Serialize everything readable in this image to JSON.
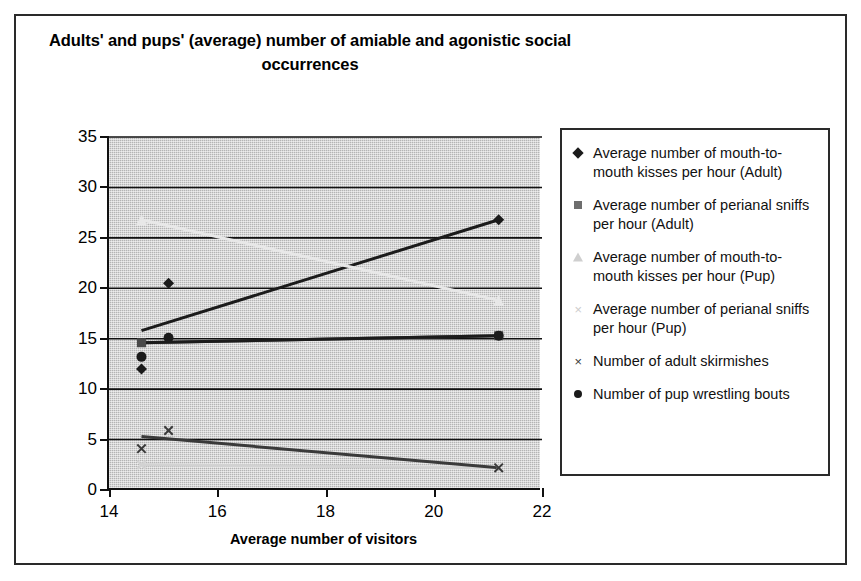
{
  "chart_data": {
    "type": "line",
    "title": "Adults' and pups' (average) number of amiable and agonistic social occurrences",
    "xlabel": "Average number of visitors",
    "ylabel": "Number of occurren",
    "xlim": [
      14,
      22
    ],
    "ylim": [
      0,
      35
    ],
    "xticks": [
      14,
      16,
      18,
      20,
      22
    ],
    "yticks": [
      0,
      5,
      10,
      15,
      20,
      25,
      30,
      35
    ],
    "grid": "horizontal",
    "legend_position": "right",
    "plot_background": "#b4b4b4",
    "series": [
      {
        "name": "Average number of mouth-to-mouth kisses per hour (Adult)",
        "marker": "diamond",
        "color": "#1b1b1b",
        "x": [
          14.6,
          15.1,
          21.2
        ],
        "y": [
          12.0,
          20.5,
          26.8
        ],
        "trend_x": [
          14.6,
          21.2
        ],
        "trend_y": [
          15.8,
          26.8
        ]
      },
      {
        "name": "Average number of perianal sniffs per hour (Adult)",
        "marker": "square",
        "color": "#4a4a4a",
        "x": [
          14.6,
          21.2
        ],
        "y": [
          14.6,
          15.3
        ],
        "trend_x": [
          14.6,
          21.2
        ],
        "trend_y": [
          14.6,
          15.3
        ]
      },
      {
        "name": "Average number of mouth-to-mouth kisses per hour (Pup)",
        "marker": "triangle",
        "color": "#e8e8e8",
        "x": [
          14.6,
          21.2
        ],
        "y": [
          26.8,
          18.8
        ],
        "trend_x": [
          14.6,
          21.2
        ],
        "trend_y": [
          26.8,
          18.8
        ]
      },
      {
        "name": "Average number of perianal sniffs per hour (Pup)",
        "marker": "x",
        "color": "#d2d2d2",
        "x": [
          14.6,
          21.2
        ],
        "y": [
          2.5,
          2.2
        ],
        "trend_x": [
          14.6,
          21.2
        ],
        "trend_y": [
          2.5,
          2.2
        ]
      },
      {
        "name": "Number of adult skirmishes",
        "marker": "x",
        "color": "#3a3a3a",
        "x": [
          14.6,
          15.1,
          21.2
        ],
        "y": [
          4.1,
          5.9,
          2.2
        ],
        "trend_x": [
          14.6,
          21.2
        ],
        "trend_y": [
          5.3,
          2.2
        ]
      },
      {
        "name": "Number of pup wrestling bouts",
        "marker": "circle",
        "color": "#1b1b1b",
        "x": [
          14.6,
          15.1,
          21.2
        ],
        "y": [
          13.2,
          15.1,
          15.3
        ],
        "trend_x": [
          14.6,
          21.2
        ],
        "trend_y": [
          14.6,
          15.3
        ]
      }
    ]
  },
  "legend": {
    "items": [
      {
        "marker": "diamond-marker",
        "label": "Average number of mouth-to-\nmouth kisses per hour (Adult)"
      },
      {
        "marker": "square-marker",
        "label": "Average number of perianal sniffs\nper hour (Adult)"
      },
      {
        "marker": "triangle-marker",
        "label": "Average number of mouth-to-\nmouth kisses per hour (Pup)"
      },
      {
        "marker": "x-marker-light",
        "label": "Average number of perianal sniffs\nper hour (Pup)"
      },
      {
        "marker": "x-marker",
        "label": "Number of adult skirmishes"
      },
      {
        "marker": "circle-marker",
        "label": "Number of pup wrestling bouts"
      }
    ],
    "x_glyph": "×"
  },
  "axes": {
    "y_title": "Number of occurren",
    "x_title": "Average number of visitors",
    "y_tick_labels": [
      "0",
      "5",
      "10",
      "15",
      "20",
      "25",
      "30",
      "35"
    ],
    "x_tick_labels": [
      "14",
      "16",
      "18",
      "20",
      "22"
    ]
  },
  "title": {
    "line1": "Adults' and pups' (average) number of amiable and agonistic",
    "line2": "social occurrences",
    "full": "Adults' and pups' (average) number of amiable and agonistic social occurrences"
  }
}
